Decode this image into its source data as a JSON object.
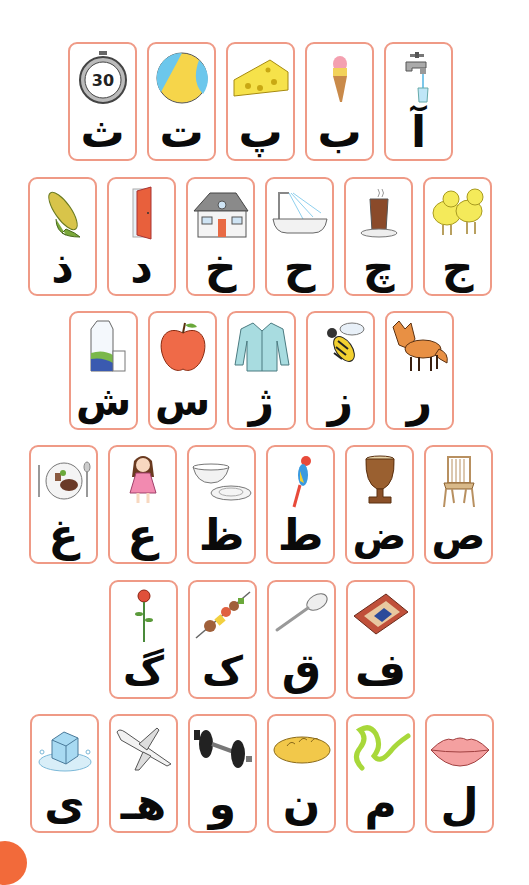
{
  "colors": {
    "card_border": "#ef9a86",
    "letter": "#0a0a0a",
    "corner_accent": "#f26a3a"
  },
  "rows": [
    {
      "cards": [
        {
          "letter": "آ",
          "picture": "faucet-with-glass"
        },
        {
          "letter": "ب",
          "picture": "ice-cream-cone"
        },
        {
          "letter": "پ",
          "picture": "cheese"
        },
        {
          "letter": "ت",
          "picture": "beach-ball"
        },
        {
          "letter": "ث",
          "picture": "stopwatch",
          "picture_text": "30"
        }
      ]
    },
    {
      "cards": [
        {
          "letter": "ج",
          "picture": "chicks"
        },
        {
          "letter": "چ",
          "picture": "tea-glass"
        },
        {
          "letter": "ح",
          "picture": "bathtub-shower"
        },
        {
          "letter": "خ",
          "picture": "house"
        },
        {
          "letter": "د",
          "picture": "door"
        },
        {
          "letter": "ذ",
          "picture": "corn"
        }
      ]
    },
    {
      "cards": [
        {
          "letter": "ر",
          "picture": "fox"
        },
        {
          "letter": "ز",
          "picture": "bee"
        },
        {
          "letter": "ژ",
          "picture": "cardigan"
        },
        {
          "letter": "س",
          "picture": "apple"
        },
        {
          "letter": "ش",
          "picture": "milk-carton-glass"
        }
      ]
    },
    {
      "cards": [
        {
          "letter": "ص",
          "picture": "chair"
        },
        {
          "letter": "ض",
          "picture": "drum-zarb"
        },
        {
          "letter": "ط",
          "picture": "parrot"
        },
        {
          "letter": "ظ",
          "picture": "bowl-plate"
        },
        {
          "letter": "ع",
          "picture": "doll"
        },
        {
          "letter": "غ",
          "picture": "meal-plate"
        }
      ]
    },
    {
      "cards": [
        {
          "letter": "ف",
          "picture": "rug"
        },
        {
          "letter": "ق",
          "picture": "spoon"
        },
        {
          "letter": "ک",
          "picture": "kebab"
        },
        {
          "letter": "گ",
          "picture": "rose"
        }
      ]
    },
    {
      "cards": [
        {
          "letter": "ل",
          "picture": "lips"
        },
        {
          "letter": "م",
          "picture": "snake"
        },
        {
          "letter": "ن",
          "picture": "bread"
        },
        {
          "letter": "و",
          "picture": "dumbbell"
        },
        {
          "letter": "هـ",
          "picture": "airplane"
        },
        {
          "letter": "ی",
          "picture": "ice-cube"
        }
      ]
    }
  ]
}
